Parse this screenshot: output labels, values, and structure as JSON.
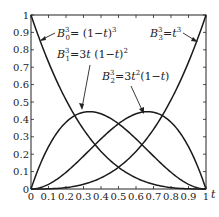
{
  "chart_data": {
    "type": "line",
    "title": "",
    "xlabel": "t",
    "ylabel": "",
    "xlim": [
      0,
      1
    ],
    "ylim": [
      0,
      1
    ],
    "grid": false,
    "x_ticks": [
      "0",
      "0.1",
      "0.2",
      "0.3",
      "0.4",
      "0.5",
      "0.6",
      "0.7",
      "0.8",
      "0.9",
      "1"
    ],
    "y_ticks": [
      "0",
      "0.1",
      "0.2",
      "0.3",
      "0.4",
      "0.5",
      "0.6",
      "0.7",
      "0.8",
      "0.9",
      "1"
    ],
    "x": [
      0,
      0.1,
      0.2,
      0.3,
      0.4,
      0.5,
      0.6,
      0.7,
      0.8,
      0.9,
      1
    ],
    "series": [
      {
        "name": "B_0^3 = (1-t)^3",
        "values": [
          1,
          0.729,
          0.512,
          0.343,
          0.216,
          0.125,
          0.064,
          0.027,
          0.008,
          0.001,
          0
        ]
      },
      {
        "name": "B_1^3 = 3t(1-t)^2",
        "values": [
          0,
          0.243,
          0.384,
          0.441,
          0.432,
          0.375,
          0.288,
          0.189,
          0.096,
          0.027,
          0
        ]
      },
      {
        "name": "B_2^3 = 3t^2(1-t)",
        "values": [
          0,
          0.027,
          0.096,
          0.189,
          0.288,
          0.375,
          0.432,
          0.441,
          0.384,
          0.243,
          0
        ]
      },
      {
        "name": "B_3^3 = t^3",
        "values": [
          0,
          0.001,
          0.008,
          0.027,
          0.064,
          0.125,
          0.216,
          0.343,
          0.512,
          0.729,
          1
        ]
      }
    ],
    "annotations": [
      {
        "text": "B_0^3 = (1-t)^3",
        "points_to_t": 0.05
      },
      {
        "text": "B_1^3 = 3t(1-t)^2",
        "points_to_t": 0.27
      },
      {
        "text": "B_2^3 = 3t^2(1-t)",
        "points_to_t": 0.7
      },
      {
        "text": "B_3^3 = t^3",
        "points_to_t": 0.93
      }
    ]
  },
  "labels": {
    "b0": {
      "base": "B",
      "sub": "0",
      "sup": "3",
      "rhs": "= (1−",
      "var": "t",
      "tail": ")",
      "pow": "3"
    },
    "b1": {
      "base": "B",
      "sub": "1",
      "sup": "3",
      "rhs": "=3",
      "var": "t",
      "tail": " (1−",
      "var2": "t",
      "tail2": ")",
      "pow": "2"
    },
    "b2": {
      "base": "B",
      "sub": "2",
      "sup": "3",
      "rhs": "=3",
      "var": "t",
      "pow1": "2",
      "tail": "(1−",
      "var2": "t",
      "tail2": ")"
    },
    "b3": {
      "base": "B",
      "sub": "3",
      "sup": "3",
      "rhs": "=",
      "var": "t",
      "pow": "3"
    },
    "x_axis_var": "t"
  }
}
